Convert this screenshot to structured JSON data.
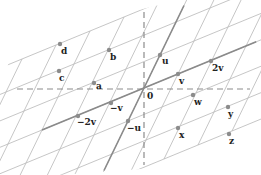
{
  "diagram": {
    "title": "",
    "origin_px": [
      144,
      88
    ],
    "basis": {
      "u_px": [
        16,
        -33
      ],
      "v_px": [
        34,
        -14
      ]
    },
    "colors": {
      "lattice_line": "#b8b8b8",
      "axis_line": "#8c8c8c",
      "span_line": "#8a8a8a",
      "point": "#8c8c8c",
      "label": "#222222"
    },
    "points": [
      {
        "id": "0",
        "label": "0",
        "x": 144,
        "y": 88,
        "lx": 147,
        "ly": 99,
        "dot": false
      },
      {
        "id": "u",
        "label": "u",
        "x": 160,
        "y": 55,
        "lx": 162,
        "ly": 64,
        "dot": true
      },
      {
        "id": "v",
        "label": "v",
        "x": 178,
        "y": 74,
        "lx": 179,
        "ly": 84,
        "dot": true
      },
      {
        "id": "2v",
        "label": "2v",
        "x": 211,
        "y": 61,
        "lx": 212,
        "ly": 71,
        "dot": true
      },
      {
        "id": "-v",
        "label": "−v",
        "x": 111,
        "y": 103,
        "lx": 110,
        "ly": 111,
        "dot": true
      },
      {
        "id": "-2v",
        "label": "−2v",
        "x": 78,
        "y": 116,
        "lx": 77,
        "ly": 125,
        "dot": true
      },
      {
        "id": "-u",
        "label": "−u",
        "x": 128,
        "y": 121,
        "lx": 127,
        "ly": 131,
        "dot": true
      },
      {
        "id": "a",
        "label": "a",
        "x": 94,
        "y": 83,
        "lx": 96,
        "ly": 89,
        "dot": true
      },
      {
        "id": "b",
        "label": "b",
        "x": 109,
        "y": 50,
        "lx": 110,
        "ly": 60,
        "dot": true
      },
      {
        "id": "c",
        "label": "c",
        "x": 59,
        "y": 71,
        "lx": 59,
        "ly": 81,
        "dot": true
      },
      {
        "id": "d",
        "label": "d",
        "x": 60,
        "y": 44,
        "lx": 61,
        "ly": 54,
        "dot": true
      },
      {
        "id": "w",
        "label": "w",
        "x": 193,
        "y": 95,
        "lx": 194,
        "ly": 105,
        "dot": true
      },
      {
        "id": "x",
        "label": "x",
        "x": 178,
        "y": 128,
        "lx": 179,
        "ly": 138,
        "dot": true
      },
      {
        "id": "y",
        "label": "y",
        "x": 228,
        "y": 107,
        "lx": 228,
        "ly": 117,
        "dot": true
      },
      {
        "id": "z",
        "label": "z",
        "x": 229,
        "y": 134,
        "lx": 229,
        "ly": 144,
        "dot": true
      }
    ]
  }
}
